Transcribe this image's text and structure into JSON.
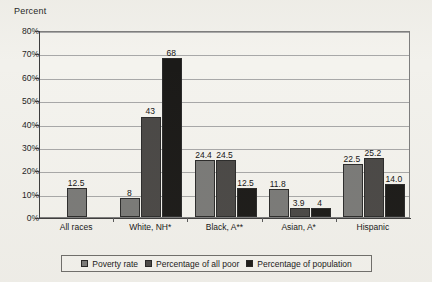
{
  "chart_data": {
    "type": "bar",
    "title": "",
    "ylabel": "Percent",
    "xlabel": "",
    "ylim": [
      0,
      80
    ],
    "ytick_labels": [
      "0%",
      "10%",
      "20%",
      "30%",
      "40%",
      "50%",
      "60%",
      "70%",
      "80%"
    ],
    "ytick_values": [
      0,
      10,
      20,
      30,
      40,
      50,
      60,
      70,
      80
    ],
    "grid": true,
    "legend_position": "bottom",
    "categories": [
      "All races",
      "White, NH*",
      "Black, A**",
      "Asian, A*",
      "Hispanic"
    ],
    "series": [
      {
        "name": "Poverty rate",
        "color": "#7a7a78",
        "values": [
          12.5,
          8,
          24.4,
          11.8,
          22.5
        ],
        "labels": [
          "12.5",
          "8",
          "24.4",
          "11.8",
          "22.5"
        ]
      },
      {
        "name": "Percentage of all poor",
        "color": "#4a4846",
        "values": [
          null,
          43,
          24.5,
          3.9,
          25.2
        ],
        "labels": [
          "",
          "43",
          "24.5",
          "3.9",
          "25.2"
        ]
      },
      {
        "name": "Percentage of population",
        "color": "#1b1a18",
        "values": [
          null,
          68,
          12.5,
          4,
          14.0
        ],
        "labels": [
          "",
          "68",
          "12.5",
          "4",
          "14.0"
        ]
      }
    ]
  },
  "legend": {
    "items": [
      {
        "label": "Poverty rate",
        "swatch": "#7a7a78"
      },
      {
        "label": "Percentage of all poor",
        "swatch": "#4a4846"
      },
      {
        "label": "Percentage of population",
        "swatch": "#1b1a18"
      }
    ]
  }
}
